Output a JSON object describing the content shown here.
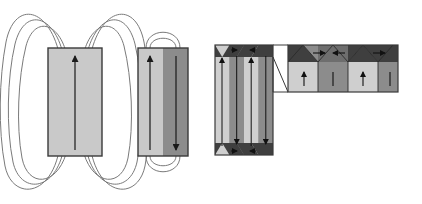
{
  "figure": {
    "background": "#ffffff",
    "width": 422,
    "height": 204
  },
  "palette": {
    "light_gray": "#c9c9c9",
    "mid_gray": "#a0a0a0",
    "dark_gray": "#6e6e6e",
    "very_dark_gray": "#4a4a4a",
    "outline": "#3a3a3a",
    "field_line": "#7a7a7a",
    "arrow": "#1a1a1a",
    "white": "#ffffff"
  },
  "panels": [
    {
      "id": "panel-single-domain",
      "name": "single-domain-magnet",
      "label": "",
      "body": {
        "x": 48,
        "y": 48,
        "width": 54,
        "height": 108,
        "fill": "#c9c9c9"
      },
      "magnetization": [
        {
          "direction": "up",
          "x": 75,
          "from_y": 150,
          "to_y": 54
        }
      ],
      "field_lines": {
        "count_per_side": 3,
        "description": "three nested closed loops exiting the top pole and returning to the bottom pole on each side",
        "spreads": [
          14,
          28,
          42
        ],
        "tops": [
          18,
          10,
          4
        ],
        "bottoms": [
          186,
          194,
          200
        ]
      }
    },
    {
      "id": "panel-two-domain",
      "name": "two-domain-magnet",
      "label": "",
      "body": {
        "x": 138,
        "y": 48,
        "width": 50,
        "height": 108
      },
      "domains": [
        {
          "name": "left-domain",
          "x": 138,
          "width": 25,
          "fill": "#c9c9c9",
          "direction": "up"
        },
        {
          "name": "right-domain",
          "x": 163,
          "width": 25,
          "fill": "#8c8c8c",
          "direction": "down"
        }
      ],
      "magnetization": [
        {
          "direction": "up",
          "x": 150,
          "from_y": 150,
          "to_y": 56
        },
        {
          "direction": "down",
          "x": 176,
          "from_y": 56,
          "to_y": 150
        }
      ],
      "field_lines": {
        "count_per_side": 2,
        "description": "two small nested loops linking the two antiparallel domains at top and bottom",
        "radii": [
          9,
          17
        ]
      }
    },
    {
      "id": "panel-stripe-domains",
      "name": "multi-domain-stripe-block",
      "label": "",
      "body": {
        "x": 215,
        "y": 45,
        "width": 58,
        "height": 110
      },
      "stripes": [
        {
          "fill": "#c9c9c9",
          "direction": "up"
        },
        {
          "fill": "#8c8c8c",
          "direction": "down"
        },
        {
          "fill": "#c9c9c9",
          "direction": "up"
        },
        {
          "fill": "#8c8c8c",
          "direction": "down"
        }
      ],
      "closure_domains": {
        "top_fill": "#3f3f3f",
        "bottom_fill": "#3f3f3f",
        "height": 12,
        "description": "triangular closure domains capping the stripe domains top and bottom"
      }
    },
    {
      "id": "panel-magnified",
      "name": "magnified-closure-domain-view",
      "label": "",
      "body": {
        "x": 288,
        "y": 45,
        "width": 110,
        "height": 47
      },
      "regions": [
        {
          "name": "closure-triangle-1",
          "fill": "#3f3f3f",
          "arrow": "right"
        },
        {
          "name": "closure-triangle-2",
          "fill": "#6e6e6e",
          "arrow": "left"
        },
        {
          "name": "closure-triangle-3",
          "fill": "#3f3f3f",
          "arrow": "right"
        },
        {
          "name": "stripe-1",
          "fill": "#cfcfcf",
          "arrow": "up"
        },
        {
          "name": "stripe-2",
          "fill": "#8c8c8c",
          "arrow": "down"
        },
        {
          "name": "stripe-3",
          "fill": "#cfcfcf",
          "arrow": "up"
        },
        {
          "name": "stripe-4",
          "fill": "#8c8c8c",
          "arrow": "down"
        }
      ],
      "connector": {
        "description": "two straight leader lines connecting the top-right corner of the stripe block to the magnified panel",
        "from": [
          273,
          48
        ],
        "to": [
          288,
          45
        ]
      }
    }
  ],
  "annotations": {
    "arrow_semantic": "magnetization-direction-arrow",
    "field_line_semantic": "magnetic-field-line"
  }
}
